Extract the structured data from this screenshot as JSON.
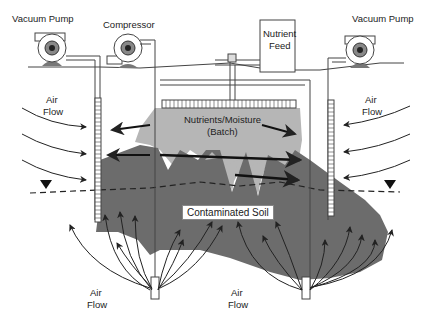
{
  "diagram": {
    "type": "bioventing / soil vapor extraction schematic",
    "labels": {
      "vacuum_pump_left": "Vacuum Pump",
      "compressor": "Compressor",
      "nutrient_feed_line1": "Nutrient",
      "nutrient_feed_line2": "Feed",
      "vacuum_pump_right": "Vacuum Pump",
      "air_flow_upper_left_1": "Air",
      "air_flow_upper_left_2": "Flow",
      "air_flow_upper_right_1": "Air",
      "air_flow_upper_right_2": "Flow",
      "nutrients_moisture_1": "Nutrients/Moisture",
      "nutrients_moisture_2": "(Batch)",
      "contaminated_soil": "Contaminated Soil",
      "air_flow_bottom_left_1": "Air",
      "air_flow_bottom_left_2": "Flow",
      "air_flow_bottom_right_1": "Air",
      "air_flow_bottom_right_2": "Flow"
    },
    "colors": {
      "soil_dark": "#6e6e6e",
      "moisture_light": "#b4b4b4",
      "line": "#333333",
      "pump_body": "#ffffff",
      "pump_base": "#777777"
    },
    "components": [
      "vacuum-pump-left",
      "compressor",
      "nutrient-feed-tank",
      "vacuum-pump-right",
      "extraction-well-left",
      "extraction-well-right",
      "injection-well-center-left",
      "injection-well-center-right",
      "nutrient-infiltration-gallery",
      "water-table"
    ]
  }
}
